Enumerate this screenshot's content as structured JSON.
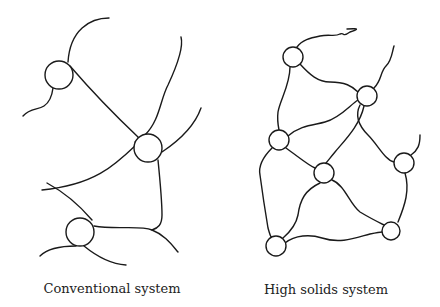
{
  "figure": {
    "panels": [
      {
        "id": "conventional",
        "caption": "Conventional system",
        "node_count": 3,
        "nodes": [
          {
            "cx": 59,
            "cy": 75,
            "r": 14
          },
          {
            "cx": 148,
            "cy": 148,
            "r": 14
          },
          {
            "cx": 80,
            "cy": 232,
            "r": 14
          }
        ]
      },
      {
        "id": "high-solids",
        "caption": "High solids system",
        "node_count": 7,
        "nodes": [
          {
            "cx": 293,
            "cy": 57,
            "r": 10
          },
          {
            "cx": 367,
            "cy": 96,
            "r": 10
          },
          {
            "cx": 279,
            "cy": 140,
            "r": 10
          },
          {
            "cx": 324,
            "cy": 173,
            "r": 10
          },
          {
            "cx": 404,
            "cy": 163,
            "r": 10
          },
          {
            "cx": 391,
            "cy": 231,
            "r": 9
          },
          {
            "cx": 276,
            "cy": 246,
            "r": 10
          }
        ]
      }
    ],
    "colors": {
      "line": "#1a1a1a",
      "background": "#ffffff",
      "text": "#222222"
    }
  }
}
